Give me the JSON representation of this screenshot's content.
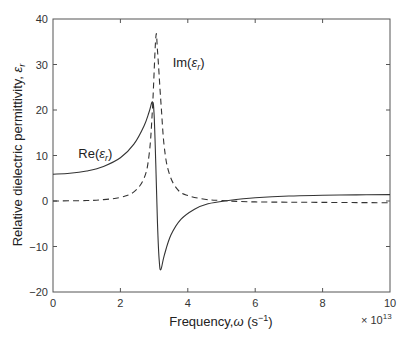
{
  "chart_data": {
    "type": "line",
    "title": "",
    "xlabel": "Frequency, ω (s⁻¹)",
    "xlabel_parts": {
      "main": "Frequency,",
      "sym": "ω",
      "unit_open": " (s",
      "unit_sup": "−1",
      "unit_close": ")"
    },
    "ylabel": "Relative dielectric permittivity, εr",
    "ylabel_parts": {
      "main": "Relative dielectric permittivity, ",
      "sym": "ε",
      "sub": "r"
    },
    "x_multiplier": "× 10^13",
    "x_multiplier_parts": {
      "base": "× 10",
      "exp": "13"
    },
    "xlim": [
      0,
      10
    ],
    "ylim": [
      -20,
      40
    ],
    "x_ticks": [
      0,
      2,
      4,
      6,
      8,
      10
    ],
    "y_ticks": [
      -20,
      -10,
      0,
      10,
      20,
      30,
      40
    ],
    "grid": false,
    "legend": "none (inline annotations)",
    "series": [
      {
        "name": "Re(εr)",
        "style": "solid",
        "color": "#333333",
        "x": [
          0,
          0.5,
          1.0,
          1.5,
          2.0,
          2.4,
          2.7,
          2.85,
          2.95,
          3.0,
          3.05,
          3.1,
          3.15,
          3.2,
          3.3,
          3.5,
          3.8,
          4.2,
          4.6,
          5.2,
          6.0,
          7.0,
          8.0,
          9.0,
          10.0
        ],
        "values": [
          5.9,
          6.1,
          6.6,
          7.6,
          9.5,
          12.5,
          16.5,
          19.5,
          21.8,
          19.0,
          8.0,
          -5.0,
          -13.0,
          -15.1,
          -12.0,
          -7.5,
          -4.0,
          -1.8,
          -0.6,
          0.1,
          0.7,
          1.1,
          1.25,
          1.35,
          1.4
        ]
      },
      {
        "name": "Im(εr)",
        "style": "dashed",
        "color": "#333333",
        "x": [
          0,
          1.0,
          1.5,
          2.0,
          2.4,
          2.7,
          2.85,
          2.95,
          3.05,
          3.1,
          3.2,
          3.3,
          3.45,
          3.7,
          4.0,
          4.5,
          5.0,
          6.0,
          8.0,
          10.0
        ],
        "values": [
          0,
          0.1,
          0.3,
          0.8,
          2.0,
          5.0,
          10.0,
          20.0,
          35.9,
          33.0,
          22.0,
          12.0,
          6.0,
          2.5,
          1.2,
          0.4,
          0.1,
          -0.2,
          -0.3,
          -0.4
        ]
      }
    ],
    "annotations": [
      {
        "text": "Re(εr)",
        "parts": {
          "pre": "Re(",
          "sym": "ε",
          "sub": "r",
          "post": ")"
        },
        "x": 0.75,
        "y": 9.5
      },
      {
        "text": "Im(εr)",
        "parts": {
          "pre": "Im(",
          "sym": "ε",
          "sub": "r",
          "post": ")"
        },
        "x": 3.55,
        "y": 29.5
      }
    ]
  }
}
